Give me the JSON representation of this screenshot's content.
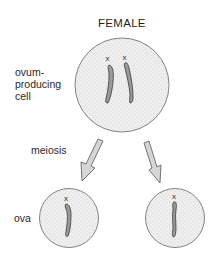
{
  "diagram": {
    "title": "FEMALE",
    "labels": {
      "parent_cell": [
        "ovum-",
        "producing",
        "cell"
      ],
      "process": "meiosis",
      "products": "ova"
    },
    "parent_cell": {
      "chromosomes": [
        {
          "label": "x"
        },
        {
          "label": "x"
        }
      ]
    },
    "ova": [
      {
        "chromosome_label": "x"
      },
      {
        "chromosome_label": "x"
      }
    ],
    "colors": {
      "cell_fill": "#ececec",
      "cell_outline": "#555555",
      "chromosome_fill": "#9a9a9a",
      "chromosome_outline": "#3a3a3a",
      "arrow_fill": "#d4d4d4",
      "arrow_outline": "#555555"
    }
  }
}
